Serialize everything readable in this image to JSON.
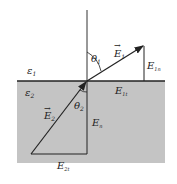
{
  "diagram": {
    "colors": {
      "medium2_fill": "#c4c4c4",
      "line": "#222222",
      "background": "#ffffff"
    },
    "labels": {
      "eps1": "ε",
      "eps1_sub": "1",
      "eps2": "ε",
      "eps2_sub": "2",
      "E1": "E",
      "E1_sub": "1",
      "E2": "E",
      "E2_sub": "2",
      "theta1": "θ",
      "theta1_sub": "1",
      "theta2": "θ",
      "theta2_sub": "2",
      "E1n": "E",
      "E1n_sub": "1n",
      "E1t": "E",
      "E1t_sub": "1t",
      "E2n": "E",
      "E2n_sub": "n",
      "E2t": "E",
      "E2t_sub": "2t"
    }
  }
}
